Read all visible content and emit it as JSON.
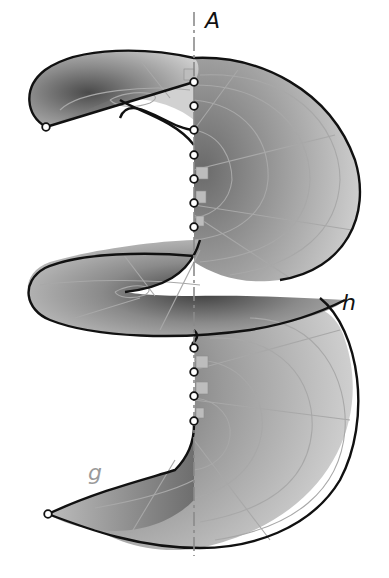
{
  "figure": {
    "labels": {
      "axis": "A",
      "helix_outer": "h",
      "generator": "g"
    },
    "colors": {
      "background": "#ffffff",
      "surface_light": "#c8c8c8",
      "surface_dark": "#555555",
      "edge": "#111111",
      "grid": "#a0a0a0",
      "axis": "#8a8a8a",
      "label_dark": "#111111",
      "label_light": "#9a9a9a"
    },
    "axis": {
      "x": 194,
      "y_top": 12,
      "y_bottom": 556
    },
    "upper_axis_points_y": [
      82,
      106,
      130,
      155,
      179,
      203,
      227
    ],
    "lower_axis_points_y": [
      348,
      372,
      396,
      421
    ],
    "endpoints": [
      {
        "name": "upper-generator-start",
        "x": 46,
        "y": 127
      },
      {
        "name": "lower-generator-start",
        "x": 48,
        "y": 514
      }
    ]
  }
}
